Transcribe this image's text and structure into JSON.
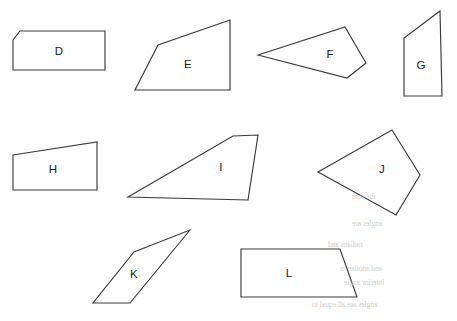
{
  "page": {
    "background_color": "#ffffff",
    "stroke_color": "#3b3b3b",
    "label_color": "#1d1d1d",
    "width": 457,
    "height": 321
  },
  "shapes": [
    {
      "label": "D",
      "name": "shape-d",
      "kind": "pentagon",
      "points": "20,31 105,31 105,70 13,70 13,40",
      "label_x": 59,
      "label_y": 52
    },
    {
      "label": "E",
      "name": "shape-e",
      "kind": "quadrilateral",
      "points": "230,20 158,45 135,90 230,90",
      "label_x": 188,
      "label_y": 65
    },
    {
      "label": "F",
      "name": "shape-f",
      "kind": "quadrilateral",
      "points": "258,55 345,27 366,63 347,78",
      "label_x": 330,
      "label_y": 55
    },
    {
      "label": "G",
      "name": "shape-g",
      "kind": "quadrilateral",
      "points": "440,11 442,96 404,96 404,38",
      "label_x": 421,
      "label_y": 66
    },
    {
      "label": "H",
      "name": "shape-h",
      "kind": "quadrilateral",
      "points": "13,155 97,142 97,190 13,190",
      "label_x": 53,
      "label_y": 170
    },
    {
      "label": "I",
      "name": "shape-i",
      "kind": "parallelogram",
      "points": "233,136 258,135 248,200 128,197",
      "label_x": 221,
      "label_y": 168
    },
    {
      "label": "J",
      "name": "shape-j",
      "kind": "quadrilateral",
      "points": "392,130 420,175 396,215 318,172",
      "label_x": 382,
      "label_y": 170
    },
    {
      "label": "K",
      "name": "shape-k",
      "kind": "parallelogram",
      "points": "190,230 130,303 93,303 134,252",
      "label_x": 134,
      "label_y": 275
    },
    {
      "label": "L",
      "name": "shape-l",
      "kind": "trapezoid",
      "points": "241,249 340,249 357,297 241,297",
      "label_x": 289,
      "label_y": 274
    }
  ],
  "bleed_through": [
    {
      "text": "angles are",
      "x": 352,
      "y": 222
    },
    {
      "text": "radians and",
      "x": 328,
      "y": 243
    },
    {
      "text": "and another is",
      "x": 340,
      "y": 267
    },
    {
      "text": "interior angle",
      "x": 344,
      "y": 281
    },
    {
      "text": "angles are all equal to",
      "x": 312,
      "y": 303
    },
    {
      "text": "the sum",
      "x": 356,
      "y": 195
    }
  ]
}
